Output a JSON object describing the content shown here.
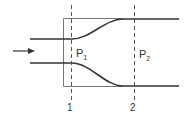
{
  "diagram": {
    "title": "",
    "flow_direction_arrow": "arrow-right-icon",
    "labels": {
      "pressure_1": "P",
      "pressure_1_sub": "1",
      "pressure_2": "P",
      "pressure_2_sub": "2",
      "section_1": "1",
      "section_2": "2"
    },
    "colors": {
      "stroke": "#333333",
      "box": "#666666",
      "dashed": "#555555",
      "background": "#ffffff"
    }
  }
}
